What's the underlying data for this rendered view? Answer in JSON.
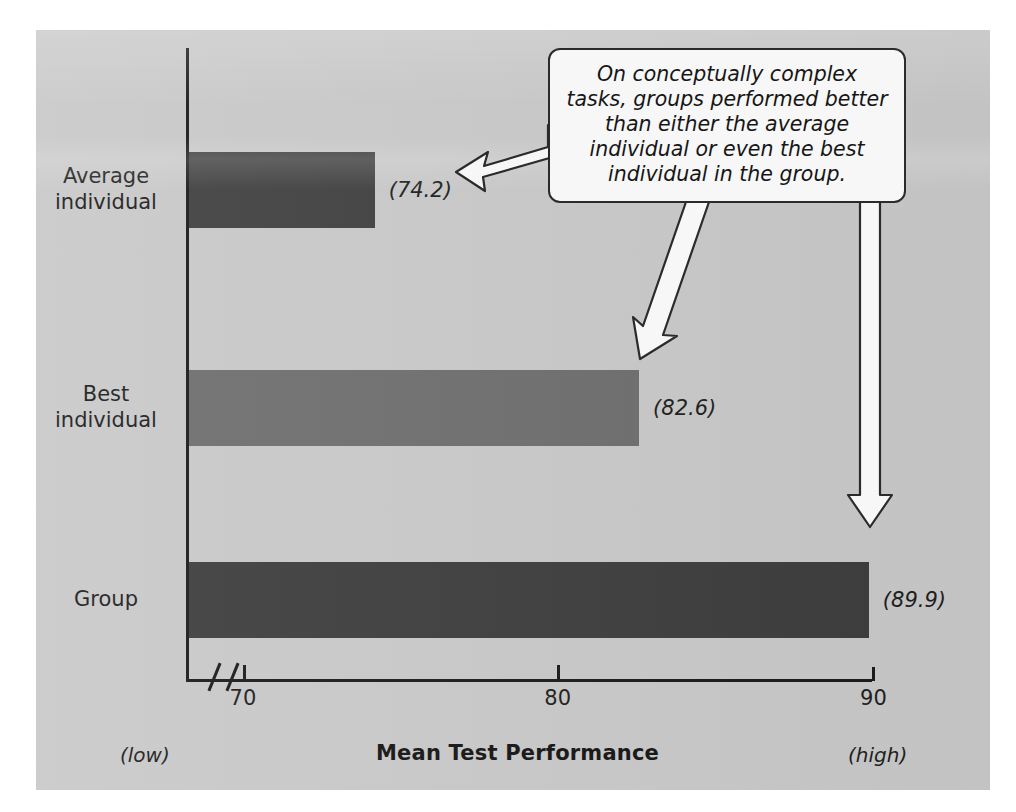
{
  "figure": {
    "background_color": "#c9c9c9",
    "callout": {
      "text": "On conceptually complex tasks, groups performed better than either the average individual or even the best individual in the group."
    },
    "annotations": {
      "low_hint": "(low)",
      "high_hint": "(high)"
    }
  },
  "chart_data": {
    "type": "bar",
    "orientation": "horizontal",
    "title": "",
    "xlabel": "Mean Test Performance",
    "ylabel": "",
    "categories": [
      "Average individual",
      "Best individual",
      "Group"
    ],
    "category_lines": [
      [
        "Average",
        "individual"
      ],
      [
        "Best",
        "individual"
      ],
      [
        "Group",
        ""
      ]
    ],
    "values": [
      74.2,
      82.6,
      89.9
    ],
    "value_labels": [
      "(74.2)",
      "(82.6)",
      "(89.9)"
    ],
    "bar_colors": [
      "#404040",
      "#6e6e6e",
      "#3d3d3d"
    ],
    "xlim": [
      68.3,
      90.0
    ],
    "xticks": [
      70,
      80,
      90
    ],
    "xtick_labels": [
      "70",
      "80",
      "90"
    ],
    "axis_break": true,
    "grid": false,
    "legend": false,
    "annotations": [
      {
        "text": "On conceptually complex tasks, groups performed better than either the average individual or even the best individual in the group.",
        "points_to": [
          "Average individual",
          "Best individual",
          "Group"
        ]
      }
    ]
  }
}
